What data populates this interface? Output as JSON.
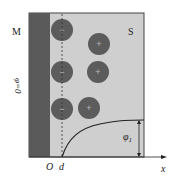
{
  "labels": {
    "metal": "M",
    "solution": "S",
    "phi_zero": "φ=0",
    "origin": "O",
    "d": "d",
    "x_axis": "x",
    "phi1": "φ",
    "phi1_sub": "1"
  },
  "colors": {
    "metal": "#5a5a5a",
    "solution": "#cfcfcf",
    "ion": "#5c5c5c",
    "line": "#333333"
  },
  "ions": [
    {
      "sign": "−",
      "cx": 62,
      "cy": 30
    },
    {
      "sign": "+",
      "cx": 99,
      "cy": 44
    },
    {
      "sign": "−",
      "cx": 62,
      "cy": 72
    },
    {
      "sign": "+",
      "cx": 98,
      "cy": 72
    },
    {
      "sign": "−",
      "cx": 62,
      "cy": 109
    },
    {
      "sign": "+",
      "cx": 89,
      "cy": 108
    }
  ]
}
